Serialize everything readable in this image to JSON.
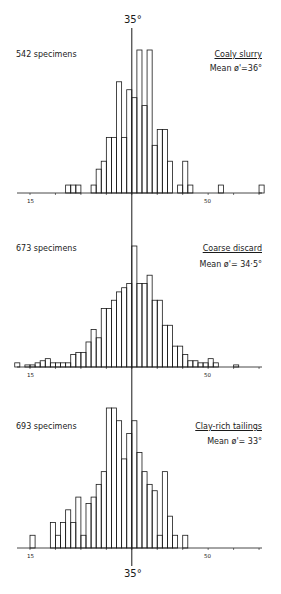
{
  "center_label_top": "35°",
  "center_label_bottom": "35°",
  "panels": [
    {
      "name": "Coaly slurry",
      "specimens": "542 specimens",
      "mean": "Mean ø'=36°",
      "tick_labels": [
        "15",
        "50"
      ]
    },
    {
      "name": "Coarse discard",
      "specimens": "673 specimens",
      "mean": "Mean ø'= 34·5°",
      "tick_labels": [
        "15",
        "50"
      ]
    },
    {
      "name": "Clay-rich tailings",
      "specimens": "693 specimens",
      "mean": "Mean ø'= 33°",
      "tick_labels": [
        "15",
        "50"
      ]
    }
  ],
  "chart_data": [
    {
      "type": "bar",
      "title": "Coaly slurry",
      "subtitle": "542 specimens",
      "annotation": "Mean ø'=36°",
      "xlabel": "Angle of friction ø' (degrees)",
      "ylabel": "Frequency",
      "reference_line": 35,
      "xlim": [
        12,
        64
      ],
      "x_ticks": [
        15,
        20,
        25,
        30,
        35,
        40,
        45,
        50,
        55,
        60
      ],
      "x_tick_labels": {
        "15": "15",
        "50": "50"
      },
      "grid": false,
      "bin_width": 1,
      "bins_start": [
        22,
        23,
        24,
        27,
        28,
        29,
        30,
        31,
        32,
        33,
        34,
        35,
        36,
        37,
        38,
        39,
        40,
        41,
        42,
        44,
        45,
        46,
        52,
        60
      ],
      "values": [
        1,
        1,
        1,
        1,
        3,
        4,
        7,
        7,
        14,
        7,
        13,
        12,
        18,
        11,
        18,
        6,
        8,
        8,
        4,
        1,
        4,
        1,
        1,
        1
      ]
    },
    {
      "type": "bar",
      "title": "Coarse discard",
      "subtitle": "673 specimens",
      "annotation": "Mean ø'= 34·5°",
      "xlabel": "Angle of friction ø' (degrees)",
      "ylabel": "Frequency",
      "reference_line": 35,
      "xlim": [
        12,
        64
      ],
      "x_ticks": [
        15,
        20,
        25,
        30,
        35,
        40,
        45,
        50,
        55,
        60
      ],
      "x_tick_labels": {
        "15": "15",
        "50": "50"
      },
      "grid": false,
      "bin_width": 1,
      "bins_start": [
        12,
        14,
        15,
        16,
        17,
        18,
        19,
        20,
        21,
        22,
        23,
        24,
        25,
        26,
        27,
        28,
        29,
        30,
        31,
        32,
        33,
        34,
        35,
        36,
        37,
        38,
        39,
        40,
        41,
        42,
        43,
        44,
        45,
        46,
        47,
        48,
        49,
        50,
        51,
        55
      ],
      "values": [
        1,
        0.5,
        0.5,
        1,
        1.5,
        2,
        1,
        1,
        1,
        1,
        3,
        3.5,
        3.5,
        6,
        9,
        7,
        14,
        14,
        16,
        18,
        19,
        20,
        29,
        20,
        20,
        22,
        16,
        16,
        10,
        10,
        5,
        5,
        3,
        1.5,
        1.5,
        1,
        1,
        2,
        1,
        0.5
      ]
    },
    {
      "type": "bar",
      "title": "Clay-rich tailings",
      "subtitle": "693 specimens",
      "annotation": "Mean ø'= 33°",
      "xlabel": "Angle of friction ø' (degrees)",
      "ylabel": "Frequency",
      "reference_line": 35,
      "xlim": [
        12,
        64
      ],
      "x_ticks": [
        15,
        20,
        25,
        30,
        35,
        40,
        45,
        50,
        55,
        60
      ],
      "x_tick_labels": {
        "15": "15",
        "50": "50"
      },
      "grid": false,
      "bin_width": 1,
      "bins_start": [
        15,
        19,
        20,
        21,
        22,
        23,
        24,
        25,
        26,
        27,
        28,
        29,
        30,
        31,
        32,
        33,
        34,
        35,
        36,
        37,
        38,
        39,
        40,
        41,
        42,
        43,
        45
      ],
      "values": [
        2,
        4,
        2,
        4,
        6,
        4,
        8,
        2,
        7,
        8,
        10,
        12,
        22,
        22,
        20,
        14,
        18,
        20,
        15,
        12,
        10,
        9,
        2,
        12,
        5,
        2,
        2
      ]
    }
  ]
}
